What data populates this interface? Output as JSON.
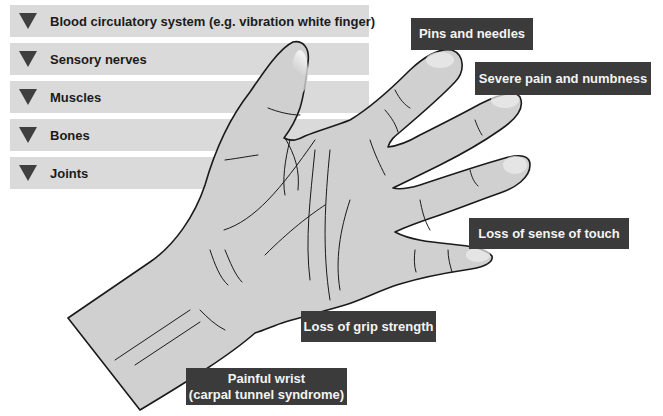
{
  "categories": [
    {
      "label": "Blood circulatory system (e.g. vibration white finger)"
    },
    {
      "label": "Sensory nerves"
    },
    {
      "label": "Muscles"
    },
    {
      "label": "Bones"
    },
    {
      "label": "Joints"
    }
  ],
  "symptoms": {
    "pins_needles": "Pins and needles",
    "severe_pain": "Severe pain and numbness",
    "loss_touch": "Loss of sense of touch",
    "loss_grip": "Loss of grip strength",
    "painful_wrist_line1": "Painful wrist",
    "painful_wrist_line2": "(carpal tunnel syndrome)"
  },
  "colors": {
    "category_bar": "#dadada",
    "triangle": "#3f3f3f",
    "label_box": "#3b3b3b",
    "label_text": "#f4f4f4",
    "hand_fill": "#d0d0d0",
    "hand_outline": "#1a1a1a"
  }
}
